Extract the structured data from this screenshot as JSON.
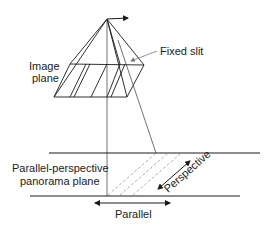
{
  "diagram": {
    "labels": {
      "image_plane_line1": "Image",
      "image_plane_line2": "plane",
      "fixed_slit": "Fixed slit",
      "panorama_line1": "Parallel-perspective",
      "panorama_line2": "panorama plane",
      "perspective": "Perspective",
      "parallel": "Parallel"
    },
    "colors": {
      "stroke": "#1a1a1a",
      "dashed": "#9a9a9a",
      "leader": "#777777"
    }
  }
}
